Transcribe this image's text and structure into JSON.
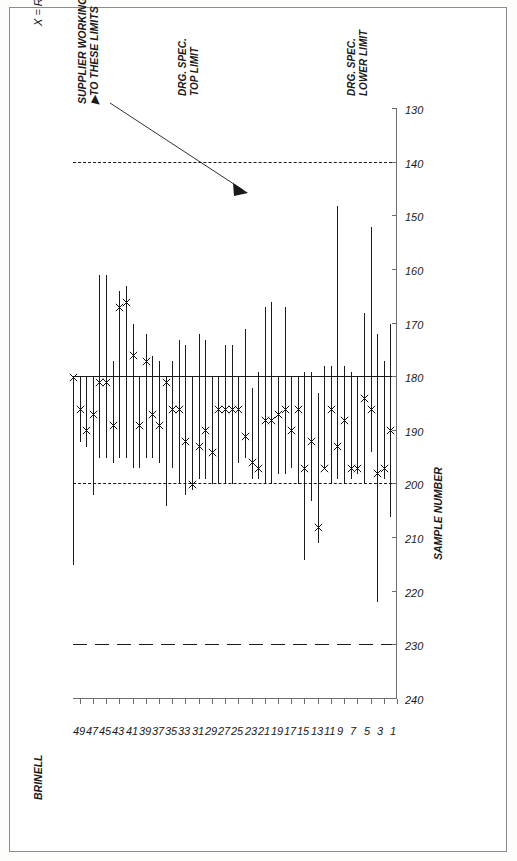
{
  "figure": {
    "legend_note": "X = Reading at position 9",
    "supplier_note": "SUPPLIER WORKING\n▶TO THESE LIMITS",
    "top_limit_label": "DRG. SPEC.\nTOP LIMIT",
    "lower_limit_label": "DRG. SPEC.\nLOWER LIMIT",
    "y_axis_title": "BRINELL",
    "x_axis_title": "SAMPLE NUMBER"
  },
  "colors": {
    "ink": "#1a1a1a",
    "axis": "#6e6e6e",
    "paper": "#ffffff",
    "border": "#8c8c8c"
  },
  "chart_data": {
    "type": "range",
    "title": "",
    "subtitle": "",
    "xlabel": "SAMPLE NUMBER",
    "ylabel": "BRINELL",
    "orientation": "rotated-90",
    "grid": false,
    "legend": {
      "position": "top-left",
      "entries": [
        "X = Reading at position 9"
      ]
    },
    "brinell_axis": {
      "ticks": [
        240,
        230,
        220,
        210,
        200,
        190,
        180,
        170,
        160,
        150,
        140,
        130
      ],
      "tick_labels": [
        "240",
        "230",
        "220",
        "210",
        "200",
        "190",
        "180",
        "170",
        "160",
        "150",
        "140",
        "130"
      ],
      "range": [
        130,
        240
      ]
    },
    "sample_axis": {
      "ticks": [
        1,
        3,
        5,
        7,
        9,
        11,
        13,
        15,
        17,
        19,
        21,
        23,
        25,
        27,
        29,
        31,
        33,
        35,
        37,
        39,
        41,
        43,
        45,
        47,
        49
      ],
      "tick_labels": [
        "1",
        "3",
        "5",
        "7",
        "9",
        "11",
        "13",
        "15",
        "17",
        "19",
        "21",
        "23",
        "25",
        "27",
        "29",
        "31",
        "33",
        "35",
        "37",
        "39",
        "41",
        "43",
        "45",
        "47",
        "49"
      ],
      "range": [
        1,
        50
      ]
    },
    "reference_lines": [
      {
        "name": "supplier-working-limit",
        "value": 230,
        "style": "long-dash",
        "label": "SUPPLIER WORKING TO THESE LIMITS"
      },
      {
        "name": "drg-spec-top-limit",
        "value": 200,
        "style": "dashed",
        "label": "DRG. SPEC. TOP LIMIT"
      },
      {
        "name": "nominal-line",
        "value": 180,
        "style": "solid",
        "label": ""
      },
      {
        "name": "drg-spec-lower-limit",
        "value": 140,
        "style": "dashed",
        "label": "DRG. SPEC. LOWER LIMIT"
      }
    ],
    "series": [
      {
        "name": "range",
        "note": "min-max Brinell spread per sample"
      },
      {
        "name": "position-9-reading",
        "note": "X marker"
      }
    ],
    "samples": [
      {
        "sample": 2,
        "min": 170,
        "max": 206,
        "x": 190
      },
      {
        "sample": 3,
        "min": 177,
        "max": 199,
        "x": 197
      },
      {
        "sample": 4,
        "min": 172,
        "max": 222,
        "x": 198
      },
      {
        "sample": 5,
        "min": 152,
        "max": 194,
        "x": 186
      },
      {
        "sample": 6,
        "min": 168,
        "max": 200,
        "x": 184
      },
      {
        "sample": 7,
        "min": 180,
        "max": 198,
        "x": 197
      },
      {
        "sample": 8,
        "min": 179,
        "max": 199,
        "x": 197
      },
      {
        "sample": 9,
        "min": 178,
        "max": 200,
        "x": 188
      },
      {
        "sample": 10,
        "min": 148,
        "max": 199,
        "x": 193
      },
      {
        "sample": 11,
        "min": 178,
        "max": 200,
        "x": 186
      },
      {
        "sample": 12,
        "min": 178,
        "max": 197,
        "x": 197
      },
      {
        "sample": 13,
        "min": 183,
        "max": 211,
        "x": 208
      },
      {
        "sample": 14,
        "min": 179,
        "max": 203,
        "x": 192
      },
      {
        "sample": 15,
        "min": 179,
        "max": 214,
        "x": 197
      },
      {
        "sample": 16,
        "min": 180,
        "max": 200,
        "x": 186
      },
      {
        "sample": 17,
        "min": 180,
        "max": 197,
        "x": 190
      },
      {
        "sample": 18,
        "min": 167,
        "max": 198,
        "x": 186
      },
      {
        "sample": 19,
        "min": 180,
        "max": 198,
        "x": 187
      },
      {
        "sample": 20,
        "min": 166,
        "max": 200,
        "x": 188
      },
      {
        "sample": 21,
        "min": 167,
        "max": 200,
        "x": 188
      },
      {
        "sample": 22,
        "min": 179,
        "max": 199,
        "x": 197
      },
      {
        "sample": 23,
        "min": 182,
        "max": 199,
        "x": 196
      },
      {
        "sample": 24,
        "min": 171,
        "max": 195,
        "x": 191
      },
      {
        "sample": 25,
        "min": 180,
        "max": 196,
        "x": 186
      },
      {
        "sample": 26,
        "min": 174,
        "max": 200,
        "x": 186
      },
      {
        "sample": 27,
        "min": 174,
        "max": 200,
        "x": 186
      },
      {
        "sample": 28,
        "min": 180,
        "max": 200,
        "x": 186
      },
      {
        "sample": 29,
        "min": 180,
        "max": 200,
        "x": 194
      },
      {
        "sample": 30,
        "min": 173,
        "max": 199,
        "x": 190
      },
      {
        "sample": 31,
        "min": 172,
        "max": 199,
        "x": 193
      },
      {
        "sample": 32,
        "min": 180,
        "max": 201,
        "x": 200
      },
      {
        "sample": 33,
        "min": 174,
        "max": 202,
        "x": 192
      },
      {
        "sample": 34,
        "min": 173,
        "max": 200,
        "x": 186
      },
      {
        "sample": 35,
        "min": 177,
        "max": 197,
        "x": 186
      },
      {
        "sample": 36,
        "min": 180,
        "max": 204,
        "x": 181
      },
      {
        "sample": 37,
        "min": 177,
        "max": 196,
        "x": 189
      },
      {
        "sample": 38,
        "min": 176,
        "max": 195,
        "x": 187
      },
      {
        "sample": 39,
        "min": 172,
        "max": 195,
        "x": 177
      },
      {
        "sample": 40,
        "min": 180,
        "max": 197,
        "x": 189
      },
      {
        "sample": 41,
        "min": 170,
        "max": 197,
        "x": 176
      },
      {
        "sample": 42,
        "min": 163,
        "max": 195,
        "x": 166
      },
      {
        "sample": 43,
        "min": 164,
        "max": 195,
        "x": 167
      },
      {
        "sample": 44,
        "min": 177,
        "max": 196,
        "x": 189
      },
      {
        "sample": 45,
        "min": 161,
        "max": 195,
        "x": 181
      },
      {
        "sample": 46,
        "min": 161,
        "max": 195,
        "x": 181
      },
      {
        "sample": 47,
        "min": 180,
        "max": 202,
        "x": 187
      },
      {
        "sample": 48,
        "min": 180,
        "max": 193,
        "x": 190
      },
      {
        "sample": 49,
        "min": 180,
        "max": 192,
        "x": 186
      },
      {
        "sample": 50,
        "min": 180,
        "max": 215,
        "x": 180
      }
    ]
  }
}
